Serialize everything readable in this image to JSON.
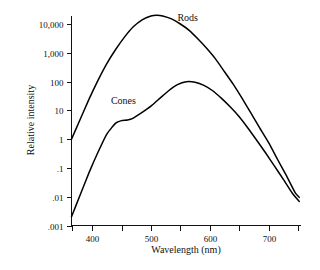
{
  "chart_data": {
    "type": "line",
    "title": "",
    "xlabel": "Wavelength (nm)",
    "ylabel": "Relative intensity",
    "xlim": [
      365,
      755
    ],
    "ylim": [
      0.001,
      30000
    ],
    "yscale": "log",
    "grid": false,
    "legend_position": "inline-annotation",
    "x_ticks": [
      {
        "value": 365,
        "label": ""
      },
      {
        "value": 400,
        "label": "400"
      },
      {
        "value": 450,
        "label": ""
      },
      {
        "value": 500,
        "label": "500"
      },
      {
        "value": 550,
        "label": ""
      },
      {
        "value": 600,
        "label": "600"
      },
      {
        "value": 650,
        "label": ""
      },
      {
        "value": 700,
        "label": "700"
      },
      {
        "value": 750,
        "label": ""
      }
    ],
    "y_ticks": [
      {
        "value": 10000,
        "label": "10,000"
      },
      {
        "value": 1000,
        "label": "1,000"
      },
      {
        "value": 100,
        "label": "100"
      },
      {
        "value": 10,
        "label": "10"
      },
      {
        "value": 1,
        "label": "1"
      },
      {
        "value": 0.1,
        "label": ".1"
      },
      {
        "value": 0.01,
        "label": ".01"
      },
      {
        "value": 0.001,
        "label": ".001"
      }
    ],
    "series": [
      {
        "name": "Rods",
        "label": "Rods",
        "color": "#000000",
        "x": [
          365,
          380,
          395,
          410,
          425,
          440,
          455,
          470,
          485,
          500,
          510,
          520,
          535,
          550,
          565,
          580,
          595,
          610,
          625,
          640,
          655,
          670,
          685,
          700,
          715,
          730,
          745,
          752
        ],
        "y": [
          1.0,
          5.0,
          25.0,
          110.0,
          420.0,
          1300.0,
          3500.0,
          8000.0,
          14000.0,
          19000.0,
          20000.0,
          19000.0,
          15000.0,
          10000.0,
          6000.0,
          3000.0,
          1400.0,
          600.0,
          220.0,
          80.0,
          26.0,
          8.0,
          2.4,
          0.75,
          0.2,
          0.055,
          0.014,
          0.0095
        ]
      },
      {
        "name": "Cones",
        "label": "Cones",
        "color": "#000000",
        "x": [
          365,
          380,
          395,
          410,
          425,
          440,
          450,
          460,
          470,
          485,
          500,
          515,
          530,
          545,
          560,
          575,
          590,
          605,
          620,
          635,
          650,
          665,
          680,
          695,
          710,
          725,
          740,
          752
        ],
        "y": [
          0.002,
          0.012,
          0.07,
          0.35,
          1.5,
          3.6,
          4.4,
          4.6,
          5.4,
          8.5,
          14.0,
          26.0,
          48.0,
          78.0,
          99.0,
          95.0,
          74.0,
          48.0,
          26.0,
          13.0,
          6.0,
          2.4,
          0.9,
          0.33,
          0.115,
          0.04,
          0.0135,
          0.0068
        ]
      }
    ],
    "annotations": [
      {
        "text": "Rods",
        "x": 545,
        "y": 13000
      },
      {
        "text": "Cones",
        "x": 432,
        "y": 17
      }
    ]
  },
  "figure": {
    "y_axis_title": "Relative intensity",
    "x_axis_title": "Wavelength (nm)"
  }
}
